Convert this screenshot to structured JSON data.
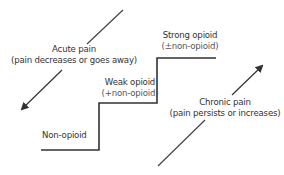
{
  "diagram": {
    "type": "analgesic-ladder",
    "colors": {
      "line": "#333333",
      "text": "#333333",
      "subtext": "#555555",
      "background": "#ffffff"
    },
    "steps": [
      {
        "id": "non-opioid",
        "title": "Non-opioid",
        "subtitle": ""
      },
      {
        "id": "weak-opioid",
        "title": "Weak opioid",
        "subtitle": "(+non-opioid)"
      },
      {
        "id": "strong-opioid",
        "title": "Strong opioid",
        "subtitle": "(±non-opioid)"
      }
    ],
    "arrows": [
      {
        "id": "acute",
        "title": "Acute pain",
        "subtitle": "(pain decreases or goes away)",
        "direction": "down-left"
      },
      {
        "id": "chronic",
        "title": "Chronic pain",
        "subtitle": "(pain persists or increases)",
        "direction": "up-right"
      }
    ]
  }
}
